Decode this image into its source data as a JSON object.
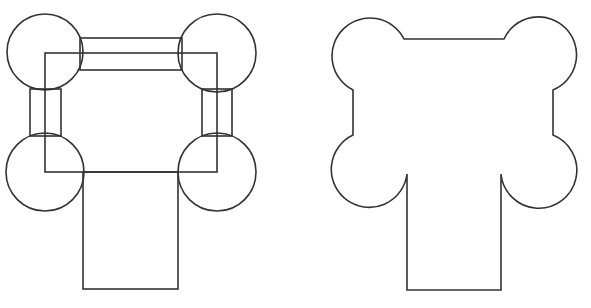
{
  "diagram": {
    "stroke_color": "#333333",
    "background": "#ffffff",
    "left_figure": {
      "label": "component shapes",
      "circles": [
        {
          "cx": 45,
          "cy": 52,
          "r": 38
        },
        {
          "cx": 217,
          "cy": 53,
          "r": 39
        },
        {
          "cx": 45,
          "cy": 172,
          "r": 39
        },
        {
          "cx": 217,
          "cy": 172,
          "r": 39
        }
      ],
      "rects": [
        {
          "name": "top-connector",
          "x": 80,
          "y": 38,
          "w": 102,
          "h": 32
        },
        {
          "name": "left-connector",
          "x": 30,
          "y": 89,
          "w": 31,
          "h": 47
        },
        {
          "name": "right-connector",
          "x": 202,
          "y": 89,
          "w": 30,
          "h": 47
        },
        {
          "name": "center-frame",
          "x": 45,
          "y": 53,
          "w": 172,
          "h": 119
        },
        {
          "name": "stem",
          "x": 83,
          "y": 172,
          "w": 95,
          "h": 117
        }
      ]
    },
    "right_figure": {
      "label": "merged outline"
    }
  }
}
